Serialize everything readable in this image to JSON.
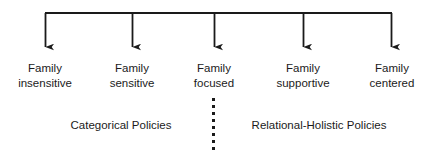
{
  "diagram": {
    "type": "continuum-arrow-diagram",
    "orientation": "horizontal-bracket-with-down-arrows",
    "line_color": "#1a1a1a",
    "text_color": "#1b1b1b",
    "background_color": "#ffffff",
    "bracket": {
      "name": "horizontal-connector-bar",
      "x_start": 45,
      "x_end": 392,
      "y": 13
    },
    "divider": {
      "name": "vertical-dashed-divider",
      "x": 213,
      "y_start": 98,
      "y_end": 152,
      "style": "dashed"
    },
    "nodes": [
      {
        "id": "family-insensitive",
        "line1": "Family",
        "line2": "insensitive",
        "x": 45,
        "arrow_top": 13,
        "arrow_tip": 56
      },
      {
        "id": "family-sensitive",
        "line1": "Family",
        "line2": "sensitive",
        "x": 132,
        "arrow_top": 13,
        "arrow_tip": 56
      },
      {
        "id": "family-focused",
        "line1": "Family",
        "line2": "focused",
        "x": 214,
        "arrow_top": 13,
        "arrow_tip": 56
      },
      {
        "id": "family-supportive",
        "line1": "Family",
        "line2": "supportive",
        "x": 303,
        "arrow_top": 13,
        "arrow_tip": 56
      },
      {
        "id": "family-centered",
        "line1": "Family",
        "line2": "centered",
        "x": 392,
        "arrow_top": 13,
        "arrow_tip": 56
      }
    ],
    "groups": [
      {
        "id": "categorical-policies",
        "label": "Categorical Policies",
        "x": 121,
        "y": 118
      },
      {
        "id": "relational-holistic-policies",
        "label": "Relational-Holistic Policies",
        "x": 319,
        "y": 118
      }
    ]
  }
}
